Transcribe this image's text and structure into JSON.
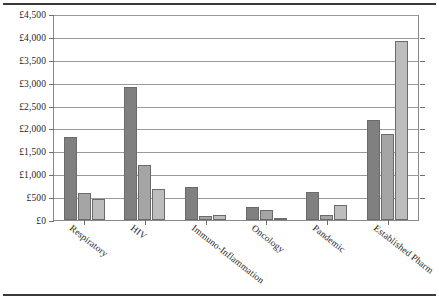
{
  "chart_data": {
    "type": "bar",
    "title": "",
    "xlabel": "",
    "ylabel": "",
    "ylim": [
      0,
      4500
    ],
    "grid": true,
    "legend": "none",
    "currency_prefix": "£",
    "categories": [
      "Respiratory",
      "HIV",
      "Immuno-Inflammation",
      "Oncology",
      "Pandemic",
      "Established Pharm"
    ],
    "ytick_labels": [
      "£4,500",
      "£4,000",
      "£3,500",
      "£3,000",
      "£2,500",
      "£2,000",
      "£1,500",
      "£1,000",
      "£500",
      "£0"
    ],
    "ytick_values": [
      4500,
      4000,
      3500,
      3000,
      2500,
      2000,
      1500,
      1000,
      500,
      0
    ],
    "series": [
      {
        "name": "Series 1",
        "color": "#808080",
        "values": [
          1820,
          2900,
          730,
          280,
          620,
          2180
        ]
      },
      {
        "name": "Series 2",
        "color": "#a5a5a5",
        "values": [
          600,
          1200,
          90,
          210,
          100,
          1870
        ]
      },
      {
        "name": "Series 3",
        "color": "#bdbdbd",
        "values": [
          450,
          680,
          100,
          30,
          320,
          3900
        ]
      }
    ]
  }
}
